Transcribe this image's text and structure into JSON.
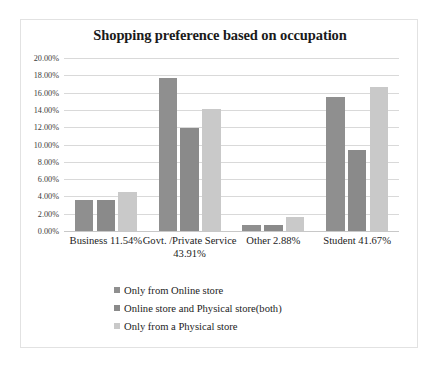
{
  "chart_data": {
    "type": "bar",
    "title": "Shopping preference based on occupation",
    "xlabel": "",
    "ylabel": "",
    "ylim": [
      0,
      20
    ],
    "grid": true,
    "legend_position": "bottom",
    "y_ticks": [
      "0.00%",
      "2.00%",
      "4.00%",
      "6.00%",
      "8.00%",
      "10.00%",
      "12.00%",
      "14.00%",
      "16.00%",
      "18.00%",
      "20.00%"
    ],
    "y_tick_values": [
      0,
      2,
      4,
      6,
      8,
      10,
      12,
      14,
      16,
      18,
      20
    ],
    "categories": [
      "Business 11.54%",
      "Govt. /Private Service 43.91%",
      "Other 2.88%",
      "Student 41.67%"
    ],
    "series": [
      {
        "name": "Only from Online store",
        "color": "#8f8f8f",
        "values": [
          3.55,
          17.7,
          0.7,
          15.45
        ]
      },
      {
        "name": "Online store and Physical store(both)",
        "color": "#8a8a8a",
        "values": [
          3.55,
          11.9,
          0.7,
          9.4
        ]
      },
      {
        "name": "Only from a Physical store",
        "color": "#c9c9c9",
        "values": [
          4.5,
          14.1,
          1.65,
          16.65
        ]
      }
    ]
  },
  "colors": {
    "frame_border": "#e2e2e2",
    "gridline": "#d9d9d9",
    "title_text": "#1a1a1a",
    "tick_text": "#3a3a3a",
    "background": "#ffffff"
  }
}
